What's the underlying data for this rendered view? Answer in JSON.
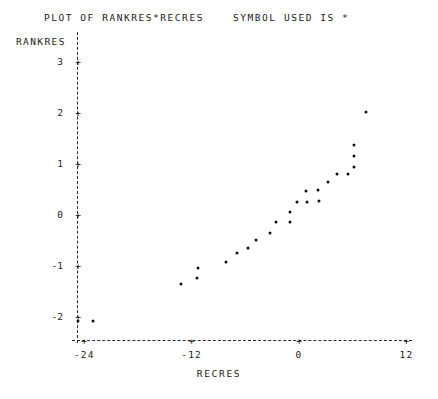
{
  "header": {
    "title": "PLOT OF RANKRES*RECRES    SYMBOL USED IS *"
  },
  "labels": {
    "ylabel": "RANKRES",
    "xlabel": "RECRES",
    "tick_marker": "+"
  },
  "chart_data": {
    "type": "scatter",
    "title": "PLOT OF RANKRES*RECRES    SYMBOL USED IS *",
    "xlabel": "RECRES",
    "ylabel": "RANKRES",
    "symbol": "*",
    "grid": false,
    "legend": "none",
    "xlim": [
      -27,
      14
    ],
    "ylim": [
      -2.6,
      3.4
    ],
    "xticks": [
      -24,
      -12,
      0,
      12
    ],
    "xtick_labels": [
      "-24",
      "-12",
      "0",
      "12"
    ],
    "yticks": [
      3,
      2,
      1,
      0,
      -1,
      -2
    ],
    "ytick_labels": [
      "3",
      "2",
      "1",
      "0",
      "-1",
      "-2"
    ],
    "points": [
      {
        "x": -24.7,
        "y": -2.08
      },
      {
        "x": -23.0,
        "y": -2.08
      },
      {
        "x": -13.2,
        "y": -1.35
      },
      {
        "x": -11.4,
        "y": -1.24
      },
      {
        "x": -11.3,
        "y": -1.04
      },
      {
        "x": -8.2,
        "y": -0.92
      },
      {
        "x": -6.9,
        "y": -0.75
      },
      {
        "x": -5.7,
        "y": -0.65
      },
      {
        "x": -4.8,
        "y": -0.49
      },
      {
        "x": -3.2,
        "y": -0.35
      },
      {
        "x": -2.6,
        "y": -0.14
      },
      {
        "x": -1.0,
        "y": -0.14
      },
      {
        "x": -1.0,
        "y": 0.06
      },
      {
        "x": -0.2,
        "y": 0.25
      },
      {
        "x": 0.9,
        "y": 0.25
      },
      {
        "x": 0.8,
        "y": 0.47
      },
      {
        "x": 2.1,
        "y": 0.49
      },
      {
        "x": 2.2,
        "y": 0.27
      },
      {
        "x": 3.2,
        "y": 0.65
      },
      {
        "x": 4.3,
        "y": 0.8
      },
      {
        "x": 5.5,
        "y": 0.8
      },
      {
        "x": 6.1,
        "y": 0.94
      },
      {
        "x": 6.1,
        "y": 1.16
      },
      {
        "x": 6.1,
        "y": 1.37
      },
      {
        "x": 7.5,
        "y": 2.02
      }
    ]
  }
}
